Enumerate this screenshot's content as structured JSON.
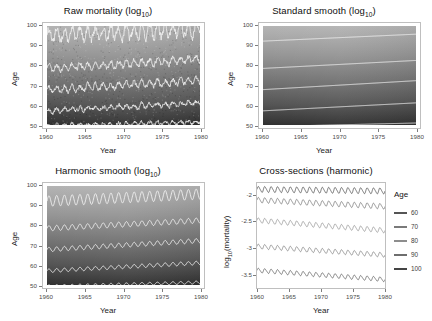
{
  "figure": {
    "background": "#ffffff",
    "width": 432,
    "height": 321
  },
  "panels": {
    "raw": {
      "title_main": "Raw mortality (log",
      "title_sub": "10",
      "title_tail": ")",
      "title_full": "Raw mortality (log10)",
      "xlabel": "Year",
      "ylabel": "Age",
      "xticks": [
        "1960",
        "1965",
        "1970",
        "1975",
        "1980"
      ],
      "yticks": [
        "50",
        "60",
        "70",
        "80",
        "90",
        "100"
      ]
    },
    "standard": {
      "title_main": "Standard smooth (log",
      "title_sub": "10",
      "title_tail": ")",
      "title_full": "Standard smooth (log10)",
      "xlabel": "Year",
      "ylabel": "Age",
      "xticks": [
        "1960",
        "1965",
        "1970",
        "1975",
        "1980"
      ],
      "yticks": [
        "50",
        "60",
        "70",
        "80",
        "90",
        "100"
      ]
    },
    "harmonic": {
      "title_main": "Harmonic smooth (log",
      "title_sub": "10",
      "title_tail": ")",
      "title_full": "Harmonic smooth (log10)",
      "xlabel": "Year",
      "ylabel": "Age",
      "xticks": [
        "1960",
        "1965",
        "1970",
        "1975",
        "1980"
      ],
      "yticks": [
        "50",
        "60",
        "70",
        "80",
        "90",
        "100"
      ]
    },
    "cross": {
      "title_full": "Cross-sections (harmonic)",
      "xlabel": "Year",
      "ylabel_main": "log",
      "ylabel_sub": "10",
      "ylabel_tail": "(mortality)",
      "ylabel_full": "log10(mortality)",
      "xticks": [
        "1960",
        "1965",
        "1970",
        "1975",
        "1980"
      ],
      "yticks": [
        "-2.0",
        "-2.5",
        "-3.0",
        "-3.5"
      ],
      "legend": {
        "title": "Age",
        "items": [
          {
            "label": "60",
            "color": "#555555"
          },
          {
            "label": "70",
            "color": "#7a7a7a"
          },
          {
            "label": "80",
            "color": "#8d8d8d"
          },
          {
            "label": "90",
            "color": "#6e6e6e"
          },
          {
            "label": "100",
            "color": "#444444"
          }
        ]
      }
    }
  },
  "chart_data": [
    {
      "id": "raw",
      "type": "heatmap",
      "title": "Raw mortality (log10)",
      "xlabel": "Year",
      "ylabel": "Age",
      "xlim": [
        1960,
        1980
      ],
      "ylim": [
        50,
        100
      ],
      "xticks": [
        1960,
        1965,
        1970,
        1975,
        1980
      ],
      "yticks": [
        50,
        60,
        70,
        80,
        90,
        100
      ],
      "grid": false,
      "colormap": "grayscale",
      "value_range": [
        -3.6,
        -1.8
      ],
      "note": "Lighter shading at high age, darker at low age; noisy raw monthly data with strong seasonal oscillation.",
      "contours": [
        {
          "level": -1.9,
          "age_start": 95.0,
          "age_end": 98.5,
          "oscillation": 3.2,
          "noise": 1.6
        },
        {
          "level": -2.2,
          "age_start": 79.0,
          "age_end": 83.5,
          "oscillation": 1.5,
          "noise": 0.9
        },
        {
          "level": -2.6,
          "age_start": 68.5,
          "age_end": 73.0,
          "oscillation": 1.4,
          "noise": 0.9
        },
        {
          "level": -3.0,
          "age_start": 58.0,
          "age_end": 62.0,
          "oscillation": 1.0,
          "noise": 0.8
        },
        {
          "level": -3.4,
          "age_start": 50.5,
          "age_end": 52.5,
          "oscillation": 0.8,
          "noise": 0.7
        }
      ]
    },
    {
      "id": "standard",
      "type": "heatmap",
      "title": "Standard smooth (log10)",
      "xlabel": "Year",
      "ylabel": "Age",
      "xlim": [
        1960,
        1980
      ],
      "ylim": [
        50,
        100
      ],
      "xticks": [
        1960,
        1965,
        1970,
        1975,
        1980
      ],
      "yticks": [
        50,
        60,
        70,
        80,
        90,
        100
      ],
      "grid": false,
      "colormap": "grayscale",
      "value_range": [
        -3.6,
        -1.8
      ],
      "note": "Smooth tensor-product surface; contours are gently rising, no seasonal oscillation.",
      "contours": [
        {
          "level": -1.9,
          "age_start": 92.5,
          "age_end": 96.0,
          "oscillation": 0.0,
          "noise": 0.0
        },
        {
          "level": -2.2,
          "age_start": 79.0,
          "age_end": 83.0,
          "oscillation": 0.0,
          "noise": 0.0
        },
        {
          "level": -2.6,
          "age_start": 68.5,
          "age_end": 73.0,
          "oscillation": 0.0,
          "noise": 0.0
        },
        {
          "level": -3.0,
          "age_start": 58.0,
          "age_end": 62.0,
          "oscillation": 0.0,
          "noise": 0.0
        },
        {
          "level": -3.4,
          "age_start": 50.2,
          "age_end": 52.0,
          "oscillation": 0.0,
          "noise": 0.0
        }
      ]
    },
    {
      "id": "harmonic",
      "type": "heatmap",
      "title": "Harmonic smooth (log10)",
      "xlabel": "Year",
      "ylabel": "Age",
      "xlim": [
        1960,
        1980
      ],
      "ylim": [
        50,
        100
      ],
      "xticks": [
        1960,
        1965,
        1970,
        1975,
        1980
      ],
      "yticks": [
        50,
        60,
        70,
        80,
        90,
        100
      ],
      "grid": false,
      "colormap": "grayscale",
      "value_range": [
        -3.6,
        -1.8
      ],
      "note": "Smooth surface plus an explicit annual harmonic term; contours oscillate regularly once per year.",
      "contours": [
        {
          "level": -1.9,
          "age_start": 92.5,
          "age_end": 96.0,
          "oscillation": 2.6,
          "noise": 0.0
        },
        {
          "level": -2.2,
          "age_start": 79.0,
          "age_end": 83.0,
          "oscillation": 1.3,
          "noise": 0.0
        },
        {
          "level": -2.6,
          "age_start": 68.5,
          "age_end": 73.0,
          "oscillation": 1.1,
          "noise": 0.0
        },
        {
          "level": -3.0,
          "age_start": 58.0,
          "age_end": 62.0,
          "oscillation": 0.9,
          "noise": 0.0
        },
        {
          "level": -3.4,
          "age_start": 50.3,
          "age_end": 52.3,
          "oscillation": 0.7,
          "noise": 0.0
        }
      ]
    },
    {
      "id": "cross",
      "type": "line",
      "title": "Cross-sections (harmonic)",
      "xlabel": "Year",
      "ylabel": "log10(mortality)",
      "xlim": [
        1960,
        1980
      ],
      "ylim": [
        -3.75,
        -1.78
      ],
      "xticks": [
        1960,
        1965,
        1970,
        1975,
        1980
      ],
      "yticks": [
        -2.0,
        -2.5,
        -3.0,
        -3.5
      ],
      "grid": false,
      "legend_position": "right",
      "cycles_per_year": 1,
      "series": [
        {
          "name": "100",
          "color": "#444444",
          "y_start": -1.9,
          "y_end": -1.93,
          "amplitude": 0.052
        },
        {
          "name": "90",
          "color": "#6e6e6e",
          "y_start": -2.1,
          "y_end": -2.22,
          "amplitude": 0.048
        },
        {
          "name": "80",
          "color": "#8d8d8d",
          "y_start": -2.48,
          "y_end": -2.67,
          "amplitude": 0.045
        },
        {
          "name": "70",
          "color": "#7a7a7a",
          "y_start": -2.97,
          "y_end": -3.13,
          "amplitude": 0.042
        },
        {
          "name": "60",
          "color": "#555555",
          "y_start": -3.42,
          "y_end": -3.59,
          "amplitude": 0.04
        }
      ]
    }
  ]
}
